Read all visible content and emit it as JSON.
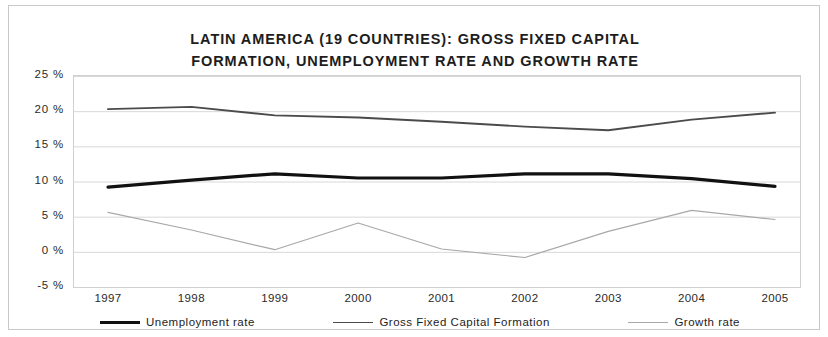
{
  "chart_data": {
    "type": "line",
    "title": "LATIN AMERICA (19 COUNTRIES): GROSS FIXED CAPITAL\nFORMATION, UNEMPLOYMENT RATE AND GROWTH RATE",
    "xlabel": "",
    "ylabel": "",
    "x": [
      "1997",
      "1998",
      "1999",
      "2000",
      "2001",
      "2002",
      "2003",
      "2004",
      "2005"
    ],
    "ytick_labels": [
      "25 %",
      "20 %",
      "15 %",
      "10 %",
      "5 %",
      "0 %",
      "-5 %"
    ],
    "ytick_values": [
      25,
      20,
      15,
      10,
      5,
      0,
      -5
    ],
    "ylim": [
      -5,
      25
    ],
    "grid": true,
    "legend_position": "bottom",
    "series": [
      {
        "name": "Unemployment rate",
        "style": "thick-solid",
        "color": "#111111",
        "values": [
          9.2,
          10.2,
          11.1,
          10.5,
          10.5,
          11.1,
          11.1,
          10.4,
          9.3
        ]
      },
      {
        "name": "Gross Fixed Capital Formation",
        "style": "medium-solid",
        "color": "#4b4b4b",
        "values": [
          20.3,
          20.6,
          19.4,
          19.1,
          18.5,
          17.8,
          17.3,
          18.8,
          19.8
        ]
      },
      {
        "name": "Growth rate",
        "style": "thin-solid",
        "color": "#a8a8a8",
        "values": [
          5.6,
          3.1,
          0.3,
          4.1,
          0.4,
          -0.8,
          2.9,
          5.9,
          4.6
        ]
      }
    ]
  },
  "legend": {
    "items": [
      {
        "label": "Unemployment rate"
      },
      {
        "label": "Gross Fixed Capital Formation"
      },
      {
        "label": "Growth rate"
      }
    ]
  }
}
